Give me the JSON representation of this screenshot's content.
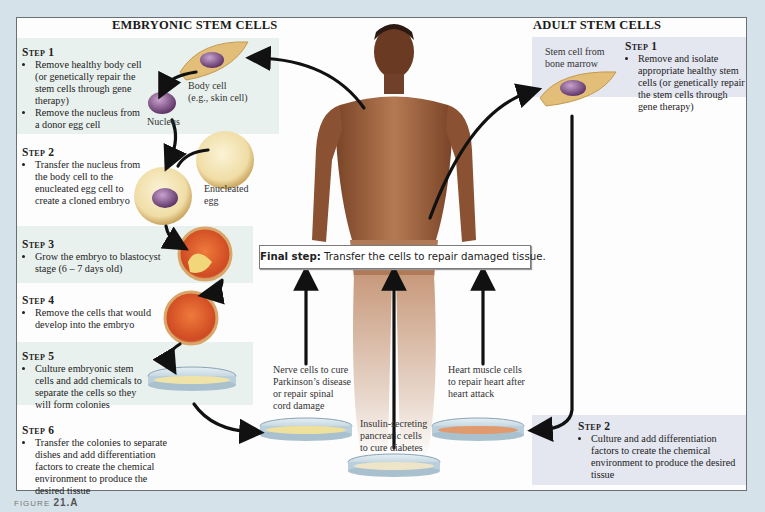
{
  "embryonic": {
    "title": "EMBRYONIC STEM CELLS",
    "steps": [
      {
        "heading": "Step 1",
        "bullets": [
          "Remove healthy body cell (or genetically repair the stem cells through gene therapy)",
          "Remove the nucleus from a donor egg cell"
        ]
      },
      {
        "heading": "Step 2",
        "bullets": [
          "Transfer the nucleus from the body cell to the enucleated egg cell to create a cloned embryo"
        ]
      },
      {
        "heading": "Step 3",
        "bullets": [
          "Grow the embryo to blastocyst stage (6 – 7 days old)"
        ]
      },
      {
        "heading": "Step 4",
        "bullets": [
          "Remove the cells that would develop into the embryo"
        ]
      },
      {
        "heading": "Step 5",
        "bullets": [
          "Culture embryonic stem cells and add chemicals to separate the cells so they will form colonies"
        ]
      },
      {
        "heading": "Step 6",
        "bullets": [
          "Transfer the colonies to separate dishes and add differentiation factors to create the chemical environment to produce the desired tissue"
        ]
      }
    ],
    "labels": {
      "body_cell": "Body cell\n(e.g., skin cell)",
      "body_cell_line1": "Body cell",
      "body_cell_line2": "(e.g., skin cell)",
      "nucleus": "Nucleus",
      "enucleated_line1": "Enucleated",
      "enucleated_line2": "egg"
    }
  },
  "adult": {
    "title": "ADULT STEM CELLS",
    "stem_cell_label_line1": "Stem cell from",
    "stem_cell_label_line2": "bone marrow",
    "steps": [
      {
        "heading": "Step 1",
        "bullets": [
          "Remove and isolate appropriate healthy stem cells (or genetically repair the stem cells through gene therapy)"
        ]
      },
      {
        "heading": "Step 2",
        "bullets": [
          "Culture and add differentiation factors to create the chemical environment to produce the desired tissue"
        ]
      }
    ]
  },
  "final_step": {
    "label": "Final step:",
    "text": " Transfer the cells to repair damaged tissue."
  },
  "outcomes": {
    "nerve": [
      "Nerve cells to cure",
      "Parkinson’s disease",
      "or repair spinal",
      "cord damage"
    ],
    "insulin": [
      "Insulin-secreting",
      "pancreatic cells",
      "to cure diabetes"
    ],
    "heart": [
      "Heart muscle cells",
      "to repair heart after",
      "heart attack"
    ]
  },
  "figure_caption": {
    "prefix": "FIGURE",
    "number": "21.A"
  },
  "colors": {
    "page_bg": "#d5e2ea",
    "panel_bg": "#fdfdfd",
    "embryonic_tint": "#e9f1ee",
    "adult_tint": "#e4e6f0",
    "arrow": "#111111",
    "cell_body": "#e6c47e",
    "nucleus": "#8a5a93",
    "embryo": "#d9542a",
    "skin": "#9a5f3a"
  }
}
